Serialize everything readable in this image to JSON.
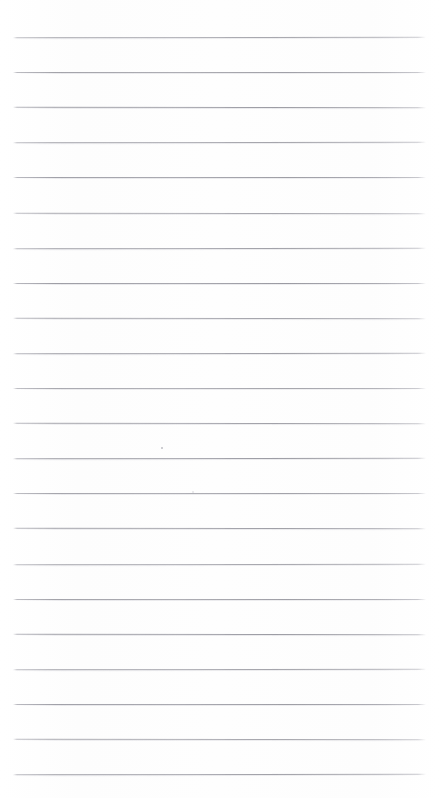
{
  "document": {
    "kind": "scanned-ruled-paper",
    "title": "Blank ruled notebook page",
    "page_width": 439,
    "page_height": 798,
    "background_color": "#fefefe",
    "text_content": "",
    "note": "No text, headings, labels, numbers or controls are visible on this page."
  },
  "ruling": {
    "line_color": "#96969e",
    "line_count": 22,
    "line_thickness": 1,
    "first_line_y": 37,
    "line_spacing": 35.1,
    "left_x": 13,
    "right_x": 426,
    "line_length": 413,
    "y_positions": [
      37,
      72,
      107,
      142,
      177,
      213,
      248,
      283,
      318,
      353,
      388,
      423,
      458,
      493,
      528,
      564,
      599,
      634,
      669,
      704,
      739,
      774
    ]
  },
  "artifacts": {
    "specks": [
      {
        "name": "scan-speck-upper",
        "x": 161,
        "y": 447,
        "size": 1.6,
        "shade": "dark"
      },
      {
        "name": "scan-speck-lower",
        "x": 192,
        "y": 491,
        "size": 2.2,
        "shade": "light"
      }
    ]
  }
}
